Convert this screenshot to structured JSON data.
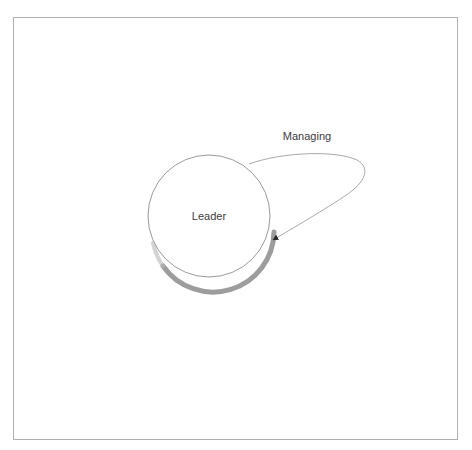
{
  "diagram": {
    "type": "state-diagram",
    "frame": {
      "label": "diagram-frame",
      "border_color": "#b0b0b0",
      "background": "#ffffff",
      "x": 13,
      "y": 17,
      "width": 445,
      "height": 423
    },
    "nodes": [
      {
        "id": "leader",
        "label": "Leader",
        "shape": "circle",
        "cx": 209,
        "cy": 216,
        "r": 61,
        "stroke": "#9a9a9a",
        "fill": "#ffffff",
        "shadow_color": "#8c8c8c",
        "label_color": "#3c3c3c"
      }
    ],
    "edges": [
      {
        "id": "managing-self-loop",
        "label": "Managing",
        "from": "leader",
        "to": "leader",
        "type": "self-loop",
        "stroke": "#a8a8a8",
        "arrowhead": "filled-triangle",
        "arrowhead_color": "#2b2b2b",
        "label_color": "#3c3c3c",
        "label_x": 307,
        "label_y": 140,
        "attach_start_x": 249,
        "attach_start_y": 164,
        "attach_end_x": 271,
        "attach_end_y": 241,
        "loop_tip_x": 363,
        "loop_tip_y": 176
      }
    ]
  }
}
